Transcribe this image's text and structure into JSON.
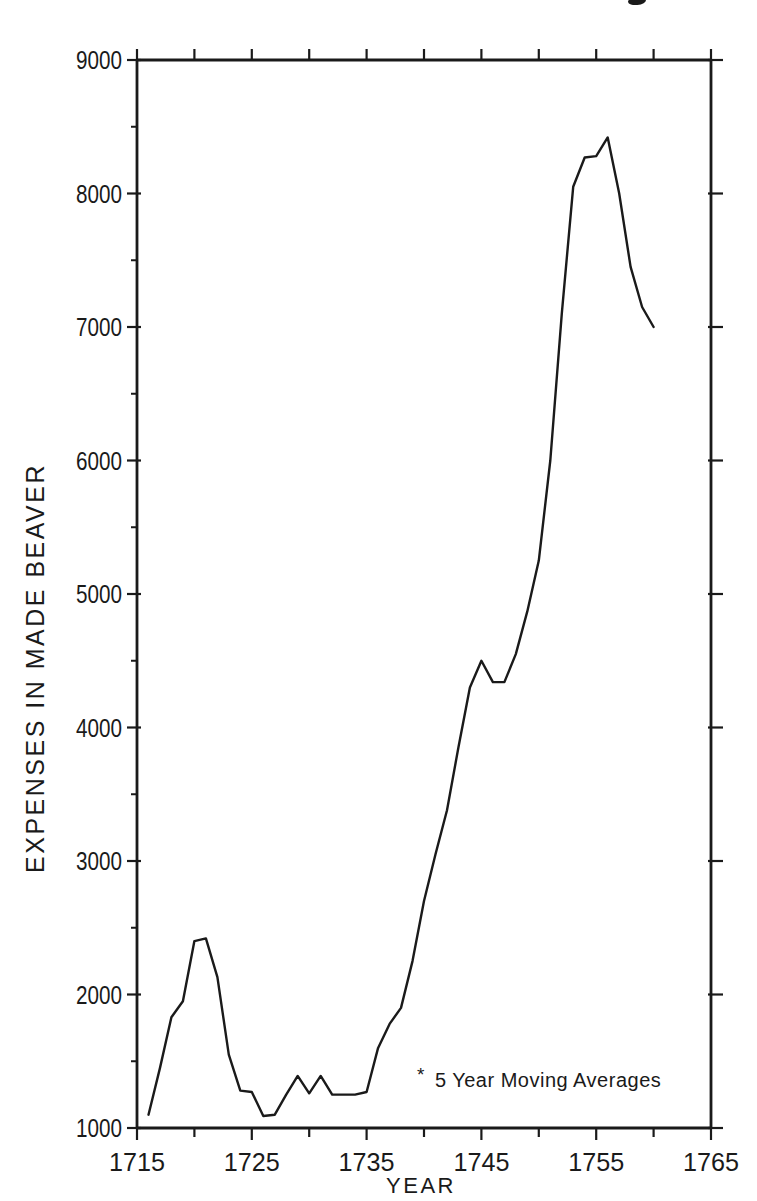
{
  "figure": {
    "background": "#ffffff",
    "ink_color": "#1a1a1a"
  },
  "chart_data": {
    "type": "line",
    "title": "",
    "xlabel": "YEAR",
    "ylabel": "EXPENSES IN MADE BEAVER",
    "annotation": {
      "marker": "*",
      "text": "5 Year Moving Averages"
    },
    "xlim": [
      1715,
      1765
    ],
    "ylim": [
      1000,
      9000
    ],
    "grid": false,
    "x_major_ticks": [
      1715,
      1725,
      1735,
      1745,
      1755,
      1765
    ],
    "x_minor_ticks": [
      1720,
      1730,
      1740,
      1750,
      1760
    ],
    "y_major_ticks": [
      1000,
      2000,
      3000,
      4000,
      5000,
      6000,
      7000,
      8000,
      9000
    ],
    "y_minor_ticks": [
      1500,
      2500,
      3500,
      4500,
      5500,
      6500,
      7500,
      8500
    ],
    "series": [
      {
        "name": "Expenses in Made Beaver (5 year moving averages)",
        "x": [
          1716,
          1717,
          1718,
          1719,
          1720,
          1721,
          1722,
          1723,
          1724,
          1725,
          1726,
          1727,
          1728,
          1729,
          1730,
          1731,
          1732,
          1733,
          1734,
          1735,
          1736,
          1737,
          1738,
          1739,
          1740,
          1741,
          1742,
          1743,
          1744,
          1745,
          1746,
          1747,
          1748,
          1749,
          1750,
          1751,
          1752,
          1753,
          1754,
          1755,
          1756,
          1757,
          1758,
          1759,
          1760
        ],
        "values": [
          1100,
          1450,
          1830,
          1950,
          2400,
          2420,
          2130,
          1550,
          1280,
          1270,
          1090,
          1100,
          1250,
          1390,
          1260,
          1390,
          1250,
          1250,
          1250,
          1270,
          1600,
          1780,
          1900,
          2250,
          2700,
          3050,
          3380,
          3850,
          4300,
          4500,
          4340,
          4340,
          4550,
          4870,
          5250,
          6000,
          7100,
          8050,
          8270,
          8280,
          8420,
          8000,
          7450,
          7150,
          7000
        ]
      }
    ]
  }
}
